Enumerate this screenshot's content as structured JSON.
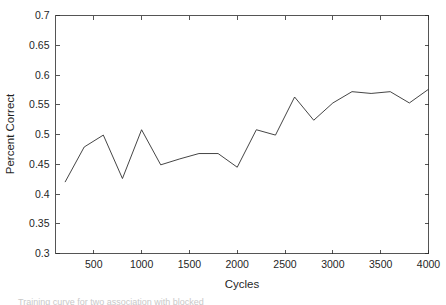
{
  "figure": {
    "background_color": "#ffffff",
    "line_color": "#303030",
    "axis_color": "#2b2b2b",
    "caption_fragment": "Training curve for two association with blocked        "
  },
  "chart_data": {
    "type": "line",
    "title": "",
    "xlabel": "Cycles",
    "ylabel": "Percent Correct",
    "xlim": [
      100,
      4000
    ],
    "ylim": [
      0.3,
      0.7
    ],
    "grid": false,
    "legend": null,
    "xticks": [
      500,
      1000,
      1500,
      2000,
      2500,
      3000,
      3500,
      4000
    ],
    "xtick_labels": [
      "500",
      "1000",
      "1500",
      "2000",
      "2500",
      "3000",
      "3500",
      "4000"
    ],
    "yticks": [
      0.3,
      0.35,
      0.4,
      0.45,
      0.5,
      0.55,
      0.6,
      0.65,
      0.7
    ],
    "ytick_labels": [
      "0.3",
      "0.35",
      "0.4",
      "0.45",
      "0.5",
      "0.55",
      "0.6",
      "0.65",
      "0.7"
    ],
    "series": [
      {
        "name": "percent correct",
        "x": [
          200,
          400,
          600,
          800,
          1000,
          1200,
          1400,
          1600,
          1800,
          2000,
          2200,
          2400,
          2600,
          2800,
          3000,
          3200,
          3400,
          3600,
          3800,
          4000
        ],
        "values": [
          0.42,
          0.479,
          0.499,
          0.426,
          0.508,
          0.449,
          0.459,
          0.468,
          0.468,
          0.445,
          0.508,
          0.499,
          0.563,
          0.524,
          0.553,
          0.572,
          0.569,
          0.572,
          0.553,
          0.576
        ]
      }
    ]
  }
}
